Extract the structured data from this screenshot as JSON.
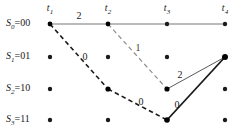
{
  "figure": {
    "type": "trellis-diagram",
    "width": 245,
    "height": 136,
    "background": "#ffffff"
  },
  "states": [
    {
      "id": "S0",
      "label_main": "S",
      "sub": "0",
      "eq": "=00",
      "y": 24
    },
    {
      "id": "S1",
      "label_main": "S",
      "sub": "1",
      "eq": "=01",
      "y": 57
    },
    {
      "id": "S2",
      "label_main": "S",
      "sub": "2",
      "eq": "=10",
      "y": 89
    },
    {
      "id": "S3",
      "label_main": "S",
      "sub": "3",
      "eq": "=11",
      "y": 120
    }
  ],
  "times": [
    {
      "id": "t1",
      "label_main": "t",
      "sub": "1",
      "x": 50
    },
    {
      "id": "t2",
      "label_main": "t",
      "sub": "2",
      "x": 108
    },
    {
      "id": "t3",
      "label_main": "t",
      "sub": "3",
      "x": 167
    },
    {
      "id": "t4",
      "label_main": "t",
      "sub": "4",
      "x": 225
    }
  ],
  "nodes": [
    {
      "time": "t1",
      "state": "S0",
      "x": 50,
      "y": 24,
      "r": 2.4,
      "emphasis": true
    },
    {
      "time": "t2",
      "state": "S0",
      "x": 108,
      "y": 24,
      "r": 2.4,
      "emphasis": true
    },
    {
      "time": "t3",
      "state": "S0",
      "x": 167,
      "y": 24,
      "r": 2.2,
      "emphasis": false
    },
    {
      "time": "t4",
      "state": "S0",
      "x": 225,
      "y": 24,
      "r": 2.2,
      "emphasis": false
    },
    {
      "time": "t1",
      "state": "S1",
      "x": 50,
      "y": 57,
      "r": 2.2,
      "emphasis": false
    },
    {
      "time": "t2",
      "state": "S1",
      "x": 108,
      "y": 57,
      "r": 2.2,
      "emphasis": false
    },
    {
      "time": "t3",
      "state": "S1",
      "x": 167,
      "y": 57,
      "r": 2.2,
      "emphasis": false
    },
    {
      "time": "t4",
      "state": "S1",
      "x": 225,
      "y": 57,
      "r": 3.0,
      "emphasis": true
    },
    {
      "time": "t1",
      "state": "S2",
      "x": 50,
      "y": 89,
      "r": 2.2,
      "emphasis": false
    },
    {
      "time": "t2",
      "state": "S2",
      "x": 108,
      "y": 89,
      "r": 2.6,
      "emphasis": true
    },
    {
      "time": "t3",
      "state": "S2",
      "x": 167,
      "y": 89,
      "r": 2.6,
      "emphasis": true
    },
    {
      "time": "t4",
      "state": "S2",
      "x": 225,
      "y": 89,
      "r": 2.2,
      "emphasis": false
    },
    {
      "time": "t1",
      "state": "S3",
      "x": 50,
      "y": 120,
      "r": 2.2,
      "emphasis": false
    },
    {
      "time": "t2",
      "state": "S3",
      "x": 108,
      "y": 120,
      "r": 2.2,
      "emphasis": false
    },
    {
      "time": "t3",
      "state": "S3",
      "x": 167,
      "y": 120,
      "r": 2.8,
      "emphasis": true
    },
    {
      "time": "t4",
      "state": "S3",
      "x": 225,
      "y": 120,
      "r": 2.2,
      "emphasis": false
    }
  ],
  "edges": [
    {
      "id": "e-t1S0-t2S0",
      "from": [
        50,
        24
      ],
      "to": [
        108,
        24
      ],
      "style": "solid",
      "color": "#777777",
      "width": 1.1
    },
    {
      "id": "e-t2S0-t3S0",
      "from": [
        108,
        24
      ],
      "to": [
        167,
        24
      ],
      "style": "solid",
      "color": "#777777",
      "width": 1.1
    },
    {
      "id": "e-t3S0-t4S0",
      "from": [
        167,
        24
      ],
      "to": [
        225,
        24
      ],
      "style": "solid",
      "color": "#777777",
      "width": 1.1
    },
    {
      "id": "e-t1S0-t2S2",
      "from": [
        50,
        24
      ],
      "to": [
        108,
        89
      ],
      "style": "dashed",
      "color": "#1a1a1a",
      "width": 1.6
    },
    {
      "id": "e-t2S2-t3S3",
      "from": [
        108,
        89
      ],
      "to": [
        167,
        120
      ],
      "style": "dashed",
      "color": "#1a1a1a",
      "width": 1.6
    },
    {
      "id": "e-t2S0-t3S2",
      "from": [
        108,
        24
      ],
      "to": [
        167,
        89
      ],
      "style": "dashed",
      "color": "#8c8c8c",
      "width": 1.2
    },
    {
      "id": "e-t3S2-t4S1",
      "from": [
        167,
        89
      ],
      "to": [
        225,
        57
      ],
      "style": "solid",
      "color": "#5a5a5a",
      "width": 1.0
    },
    {
      "id": "e-t3S3-t4S1",
      "from": [
        167,
        120
      ],
      "to": [
        225,
        57
      ],
      "style": "solid",
      "color": "#1a1a1a",
      "width": 1.8
    }
  ],
  "edge_weights": [
    {
      "id": "w-top-2",
      "value": "2",
      "x": 79,
      "y": 15,
      "tone": "dark"
    },
    {
      "id": "w-left-0",
      "value": "0",
      "x": 85,
      "y": 56,
      "tone": "dark"
    },
    {
      "id": "w-mid-1",
      "value": "1",
      "x": 138,
      "y": 47,
      "tone": "light"
    },
    {
      "id": "w-low-0",
      "value": "0",
      "x": 141,
      "y": 101,
      "tone": "dark"
    },
    {
      "id": "w-right-2",
      "value": "2",
      "x": 180,
      "y": 74,
      "tone": "dark"
    },
    {
      "id": "w-right-0",
      "value": "0",
      "x": 177,
      "y": 104,
      "tone": "dark"
    }
  ]
}
